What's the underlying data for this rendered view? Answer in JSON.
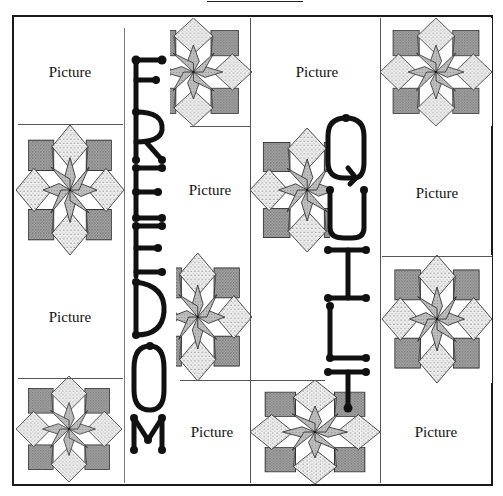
{
  "figure": {
    "type": "quilt-layout-diagram",
    "title_rule": true,
    "colors": {
      "ink": "#111111",
      "dark_fill": "#9a9a9a",
      "dotted_fill": "#e2e2e2",
      "star_fill": "#b0b0b0",
      "background": "#ffffff"
    }
  },
  "blocks": [
    {
      "row": 1,
      "col": 1,
      "kind": "picture",
      "label": "Picture"
    },
    {
      "row": 1,
      "col": 2,
      "kind": "star"
    },
    {
      "row": 1,
      "col": 3,
      "kind": "picture",
      "label": "Picture"
    },
    {
      "row": 1,
      "col": 4,
      "kind": "star"
    },
    {
      "row": 2,
      "col": 1,
      "kind": "star"
    },
    {
      "row": 2,
      "col": 2,
      "kind": "picture",
      "label": "Picture"
    },
    {
      "row": 2,
      "col": 3,
      "kind": "star"
    },
    {
      "row": 2,
      "col": 4,
      "kind": "picture",
      "label": "Picture"
    },
    {
      "row": 3,
      "col": 1,
      "kind": "picture",
      "label": "Picture"
    },
    {
      "row": 3,
      "col": 2,
      "kind": "star"
    },
    {
      "row": 3,
      "col": 3,
      "kind": "picture",
      "label": "Picture"
    },
    {
      "row": 3,
      "col": 4,
      "kind": "star"
    },
    {
      "row": 4,
      "col": 1,
      "kind": "star"
    },
    {
      "row": 4,
      "col": 2,
      "kind": "picture",
      "label": "Picture"
    },
    {
      "row": 4,
      "col": 3,
      "kind": "star"
    },
    {
      "row": 4,
      "col": 4,
      "kind": "picture",
      "label": "Picture"
    }
  ],
  "labels": {
    "picture": "Picture"
  },
  "vertical_words": [
    {
      "text": "FREEDOM",
      "letters": [
        "F",
        "R",
        "E",
        "E",
        "D",
        "O",
        "M"
      ],
      "position": "between columns 1 and 2"
    },
    {
      "text": "QUILT",
      "letters": [
        "Q",
        "U",
        "I",
        "L",
        "T"
      ],
      "position": "between columns 3 and 4"
    }
  ]
}
